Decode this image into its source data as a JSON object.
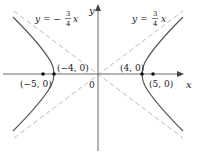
{
  "figure": {
    "colors": {
      "curve": "#555555",
      "asymptote": "#bdbdbd",
      "axis": "#6a6a6a",
      "point": "#111111",
      "text": "#222222"
    },
    "axes": {
      "x_label": "x",
      "y_label": "y",
      "origin_label": "0"
    },
    "asymptotes": [
      {
        "label_lhs": "y = −",
        "num": "3",
        "den": "4",
        "var": "x",
        "slope": -0.75
      },
      {
        "label_lhs": "y = ",
        "num": "3",
        "den": "4",
        "var": "x",
        "slope": 0.75
      }
    ],
    "points": {
      "left_vertex": "(−4, 0)",
      "right_vertex": "(4, 0)",
      "left_focus": "(−5, 0)",
      "right_focus": "(5, 0)"
    },
    "hyperbola": {
      "a": 4,
      "b": 3,
      "c": 5
    }
  }
}
